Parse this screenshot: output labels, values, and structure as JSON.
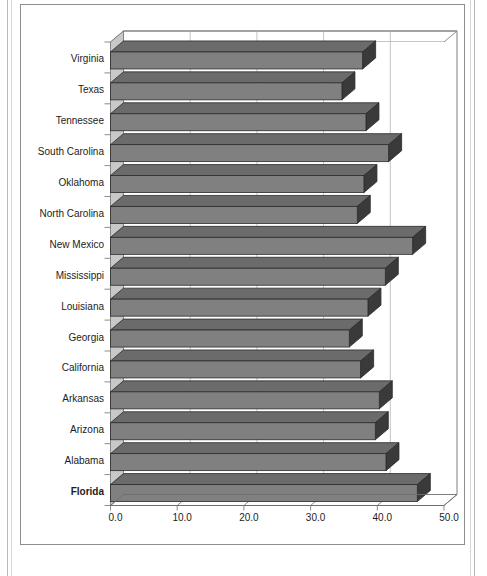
{
  "chart_data": {
    "type": "bar",
    "orientation": "horizontal",
    "style": "3d-bar",
    "title": "",
    "subtitle": "",
    "xlabel": "",
    "ylabel": "",
    "xlim": [
      0.0,
      50.0
    ],
    "xticks": [
      0.0,
      10.0,
      20.0,
      30.0,
      40.0,
      50.0
    ],
    "xtick_labels": [
      "0.0",
      "10.0",
      "20.0",
      "30.0",
      "40.0",
      "50.0"
    ],
    "grid": "vertical",
    "legend": "none",
    "highlight_category": "Florida",
    "categories": [
      "Virginia",
      "Texas",
      "Tennessee",
      "South Carolina",
      "Oklahoma",
      "North Carolina",
      "New Mexico",
      "Mississippi",
      "Louisiana",
      "Georgia",
      "California",
      "Arkansas",
      "Arizona",
      "Alabama",
      "Florida"
    ],
    "values": [
      37.8,
      34.7,
      38.3,
      41.7,
      38.0,
      37.0,
      45.3,
      41.2,
      38.6,
      35.8,
      37.5,
      40.3,
      39.7,
      41.3,
      46.0
    ],
    "colors": {
      "bar_face": "#808080",
      "bar_top": "#6b6b6b",
      "bar_side": "#3a3a3a",
      "bar_outline": "#2b2b2b",
      "wall_left": "#c8c8c8",
      "floor": "#ffffff",
      "gridline": "#b5b5b5",
      "axis": "#6e6e6e",
      "frame": "#8d8d8d",
      "text": "#1c1c1c"
    }
  }
}
